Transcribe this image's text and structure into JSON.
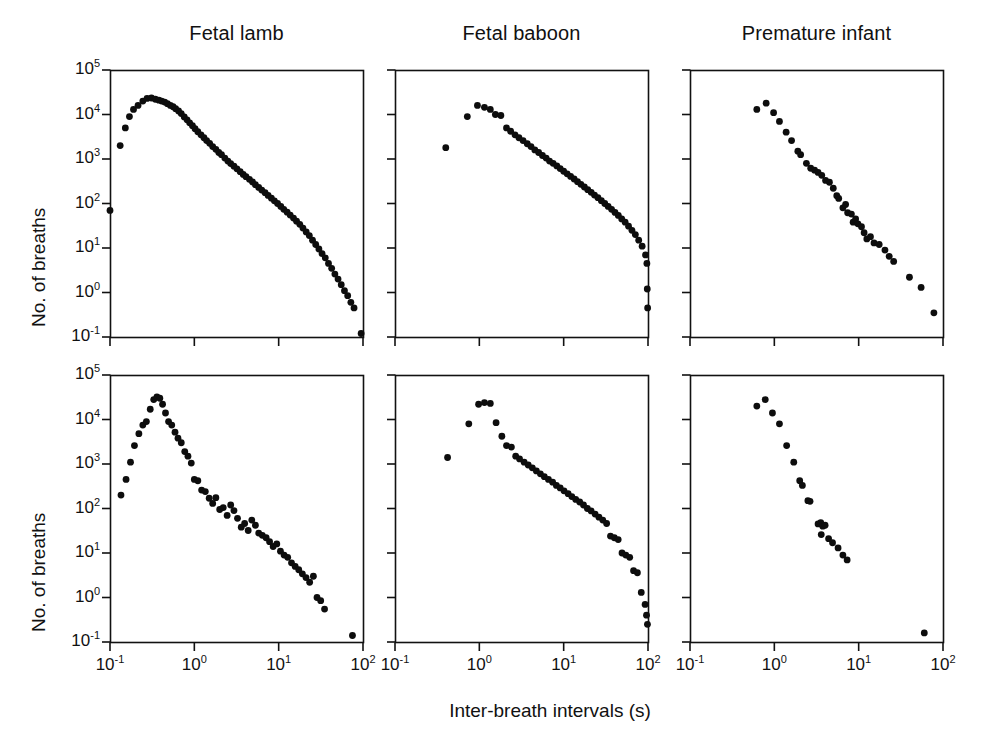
{
  "figure": {
    "xlabel": "Inter-breath intervals (s)",
    "ylabel": "No. of breaths",
    "background": "#ffffff",
    "marker_color": "#0d0d0d",
    "axis_color": "#111111"
  },
  "axes": {
    "x_ticks": [
      "10-1",
      "100",
      "101",
      "102"
    ],
    "x_tick_mantissa": [
      "10",
      "10",
      "10",
      "10"
    ],
    "x_tick_exponent": [
      "-1",
      "0",
      "1",
      "2"
    ],
    "y_ticks": [
      "105",
      "104",
      "103",
      "102",
      "101",
      "100",
      "10-1"
    ],
    "y_tick_mantissa": [
      "10",
      "10",
      "10",
      "10",
      "10",
      "10",
      "10"
    ],
    "y_tick_exponent": [
      "5",
      "4",
      "3",
      "2",
      "1",
      "0",
      "-1"
    ],
    "xlim": [
      -1,
      2
    ],
    "ylim": [
      -1,
      5
    ],
    "xscale": "log",
    "yscale": "log",
    "grid": false
  },
  "titles": {
    "col1": "Fetal lamb",
    "col2": "Fetal baboon",
    "col3": "Premature infant"
  },
  "chart_data": [
    {
      "type": "scatter",
      "panel": "top-left",
      "title": "Fetal lamb",
      "xlabel": "Inter-breath intervals (s)",
      "ylabel": "No. of breaths",
      "xlim": [
        0.1,
        100
      ],
      "ylim": [
        0.1,
        100000
      ],
      "xscale": "log",
      "yscale": "log",
      "grid": false,
      "points": [
        [
          0.1,
          70
        ],
        [
          0.132,
          2000
        ],
        [
          0.152,
          5000
        ],
        [
          0.17,
          9000
        ],
        [
          0.19,
          13000
        ],
        [
          0.215,
          16000
        ],
        [
          0.245,
          20000
        ],
        [
          0.275,
          23000
        ],
        [
          0.31,
          23500
        ],
        [
          0.345,
          22000
        ],
        [
          0.38,
          21000
        ],
        [
          0.41,
          20000
        ],
        [
          0.445,
          19000
        ],
        [
          0.48,
          17500
        ],
        [
          0.52,
          16000
        ],
        [
          0.56,
          15000
        ],
        [
          0.6,
          13500
        ],
        [
          0.65,
          12000
        ],
        [
          0.7,
          10500
        ],
        [
          0.76,
          8800
        ],
        [
          0.82,
          7600
        ],
        [
          0.88,
          6500
        ],
        [
          0.95,
          5600
        ],
        [
          1.02,
          4800
        ],
        [
          1.1,
          4100
        ],
        [
          1.2,
          3500
        ],
        [
          1.3,
          3000
        ],
        [
          1.4,
          2600
        ],
        [
          1.52,
          2250
        ],
        [
          1.65,
          1900
        ],
        [
          1.8,
          1650
        ],
        [
          1.95,
          1400
        ],
        [
          2.1,
          1250
        ],
        [
          2.3,
          1050
        ],
        [
          2.5,
          900
        ],
        [
          2.7,
          790
        ],
        [
          2.95,
          690
        ],
        [
          3.2,
          600
        ],
        [
          3.5,
          520
        ],
        [
          3.8,
          450
        ],
        [
          4.1,
          400
        ],
        [
          4.5,
          350
        ],
        [
          4.9,
          305
        ],
        [
          5.3,
          265
        ],
        [
          5.8,
          230
        ],
        [
          6.3,
          200
        ],
        [
          6.9,
          175
        ],
        [
          7.5,
          152
        ],
        [
          8.2,
          132
        ],
        [
          8.9,
          115
        ],
        [
          9.7,
          100
        ],
        [
          10.6,
          86
        ],
        [
          11.5,
          74
        ],
        [
          12.6,
          64
        ],
        [
          13.7,
          55
        ],
        [
          15.0,
          47
        ],
        [
          16.3,
          40
        ],
        [
          17.8,
          34
        ],
        [
          19.4,
          28
        ],
        [
          21.2,
          23
        ],
        [
          23.1,
          19
        ],
        [
          25.2,
          15
        ],
        [
          27.5,
          12
        ],
        [
          30.0,
          9.5
        ],
        [
          32.7,
          7.5
        ],
        [
          35.7,
          6.0
        ],
        [
          39.0,
          4.5
        ],
        [
          42.5,
          3.5
        ],
        [
          46.4,
          2.6
        ],
        [
          50.6,
          2.0
        ],
        [
          55.2,
          1.5
        ],
        [
          60.3,
          1.1
        ],
        [
          65.8,
          0.85
        ],
        [
          71.8,
          0.6
        ],
        [
          78.3,
          0.45
        ],
        [
          95.0,
          0.12
        ]
      ]
    },
    {
      "type": "scatter",
      "panel": "top-middle",
      "title": "Fetal baboon",
      "xlabel": "Inter-breath intervals (s)",
      "ylabel": "No. of breaths",
      "xlim": [
        0.1,
        100
      ],
      "ylim": [
        0.1,
        100000
      ],
      "xscale": "log",
      "yscale": "log",
      "grid": false,
      "points": [
        [
          0.4,
          1800
        ],
        [
          0.72,
          9000
        ],
        [
          0.95,
          16000
        ],
        [
          1.15,
          14500
        ],
        [
          1.35,
          13000
        ],
        [
          1.55,
          10000
        ],
        [
          1.8,
          9500
        ],
        [
          2.1,
          5000
        ],
        [
          2.35,
          4200
        ],
        [
          2.65,
          3500
        ],
        [
          2.95,
          3000
        ],
        [
          3.3,
          2600
        ],
        [
          3.7,
          2200
        ],
        [
          4.1,
          1900
        ],
        [
          4.55,
          1600
        ],
        [
          5.05,
          1400
        ],
        [
          5.6,
          1200
        ],
        [
          6.2,
          1050
        ],
        [
          6.8,
          900
        ],
        [
          7.5,
          800
        ],
        [
          8.3,
          700
        ],
        [
          9.1,
          610
        ],
        [
          10.0,
          530
        ],
        [
          11.0,
          465
        ],
        [
          12.1,
          405
        ],
        [
          13.3,
          355
        ],
        [
          14.6,
          310
        ],
        [
          16.0,
          270
        ],
        [
          17.6,
          235
        ],
        [
          19.3,
          205
        ],
        [
          21.2,
          178
        ],
        [
          23.2,
          155
        ],
        [
          25.5,
          135
        ],
        [
          28.0,
          116
        ],
        [
          30.7,
          100
        ],
        [
          33.7,
          86
        ],
        [
          37.0,
          74
        ],
        [
          40.6,
          63
        ],
        [
          44.5,
          54
        ],
        [
          48.8,
          45
        ],
        [
          53.6,
          38
        ],
        [
          58.8,
          31
        ],
        [
          64.5,
          25
        ],
        [
          70.8,
          20
        ],
        [
          77.6,
          15
        ],
        [
          85.2,
          11
        ],
        [
          93.5,
          7
        ],
        [
          97.0,
          4.5
        ],
        [
          98.0,
          1.2
        ],
        [
          99.0,
          0.45
        ]
      ]
    },
    {
      "type": "scatter",
      "panel": "top-right",
      "title": "Premature infant",
      "xlabel": "Inter-breath intervals (s)",
      "ylabel": "No. of breaths",
      "xlim": [
        0.1,
        100
      ],
      "ylim": [
        0.1,
        100000
      ],
      "xscale": "log",
      "yscale": "log",
      "grid": false,
      "points": [
        [
          0.62,
          13000
        ],
        [
          0.8,
          18000
        ],
        [
          0.98,
          11000
        ],
        [
          1.15,
          7000
        ],
        [
          1.38,
          4000
        ],
        [
          1.6,
          2600
        ],
        [
          1.9,
          1500
        ],
        [
          2.05,
          1250
        ],
        [
          2.4,
          800
        ],
        [
          2.7,
          620
        ],
        [
          3.0,
          560
        ],
        [
          3.3,
          500
        ],
        [
          3.65,
          430
        ],
        [
          4.05,
          330
        ],
        [
          4.5,
          300
        ],
        [
          5.0,
          220
        ],
        [
          5.5,
          150
        ],
        [
          5.8,
          130
        ],
        [
          6.5,
          80
        ],
        [
          7.0,
          95
        ],
        [
          7.4,
          62
        ],
        [
          8.2,
          58
        ],
        [
          8.6,
          38
        ],
        [
          9.2,
          45
        ],
        [
          9.8,
          35
        ],
        [
          10.8,
          30
        ],
        [
          11.6,
          22
        ],
        [
          12.5,
          16
        ],
        [
          13.8,
          18
        ],
        [
          15.2,
          13
        ],
        [
          17.5,
          12
        ],
        [
          20.5,
          9
        ],
        [
          23.0,
          6.5
        ],
        [
          26.0,
          5.0
        ],
        [
          40.0,
          2.2
        ],
        [
          55.0,
          1.3
        ],
        [
          78.0,
          0.35
        ]
      ]
    },
    {
      "type": "scatter",
      "panel": "bottom-left",
      "title": "Fetal lamb",
      "xlabel": "Inter-breath intervals (s)",
      "ylabel": "No. of breaths",
      "xlim": [
        0.1,
        100
      ],
      "ylim": [
        0.1,
        100000
      ],
      "xscale": "log",
      "yscale": "log",
      "grid": false,
      "points": [
        [
          0.135,
          200
        ],
        [
          0.155,
          450
        ],
        [
          0.175,
          1100
        ],
        [
          0.195,
          2600
        ],
        [
          0.22,
          4800
        ],
        [
          0.245,
          7500
        ],
        [
          0.27,
          9000
        ],
        [
          0.3,
          17000
        ],
        [
          0.33,
          28000
        ],
        [
          0.36,
          32000
        ],
        [
          0.39,
          30000
        ],
        [
          0.42,
          22000
        ],
        [
          0.455,
          14000
        ],
        [
          0.495,
          9000
        ],
        [
          0.54,
          7500
        ],
        [
          0.59,
          5200
        ],
        [
          0.64,
          3800
        ],
        [
          0.7,
          3000
        ],
        [
          0.77,
          1900
        ],
        [
          0.84,
          1500
        ],
        [
          0.92,
          1050
        ],
        [
          1.0,
          450
        ],
        [
          1.1,
          420
        ],
        [
          1.22,
          260
        ],
        [
          1.35,
          240
        ],
        [
          1.5,
          170
        ],
        [
          1.65,
          130
        ],
        [
          1.8,
          175
        ],
        [
          2.0,
          95
        ],
        [
          2.2,
          105
        ],
        [
          2.45,
          70
        ],
        [
          2.7,
          120
        ],
        [
          2.95,
          90
        ],
        [
          3.25,
          60
        ],
        [
          3.6,
          38
        ],
        [
          3.95,
          46
        ],
        [
          4.35,
          32
        ],
        [
          4.8,
          55
        ],
        [
          5.3,
          42
        ],
        [
          5.8,
          28
        ],
        [
          6.4,
          25
        ],
        [
          7.1,
          22
        ],
        [
          7.8,
          18
        ],
        [
          8.6,
          14
        ],
        [
          9.5,
          16
        ],
        [
          10.5,
          11
        ],
        [
          11.6,
          9
        ],
        [
          12.8,
          8
        ],
        [
          14.2,
          6
        ],
        [
          15.7,
          5
        ],
        [
          17.3,
          4.2
        ],
        [
          19.1,
          3.4
        ],
        [
          21.1,
          2.8
        ],
        [
          23.3,
          2.2
        ],
        [
          25.8,
          3.0
        ],
        [
          28.5,
          1.0
        ],
        [
          31.5,
          0.85
        ],
        [
          35.0,
          0.55
        ],
        [
          75.0,
          0.14
        ]
      ]
    },
    {
      "type": "scatter",
      "panel": "bottom-middle",
      "title": "Fetal baboon",
      "xlabel": "Inter-breath intervals (s)",
      "ylabel": "No. of breaths",
      "xlim": [
        0.1,
        100
      ],
      "ylim": [
        0.1,
        100000
      ],
      "xscale": "log",
      "yscale": "log",
      "grid": false,
      "points": [
        [
          0.42,
          1400
        ],
        [
          0.75,
          8000
        ],
        [
          0.98,
          22000
        ],
        [
          1.15,
          24000
        ],
        [
          1.35,
          23000
        ],
        [
          1.58,
          8500
        ],
        [
          1.85,
          4200
        ],
        [
          2.1,
          2600
        ],
        [
          2.4,
          2400
        ],
        [
          2.7,
          1500
        ],
        [
          3.0,
          1300
        ],
        [
          3.4,
          1100
        ],
        [
          3.8,
          950
        ],
        [
          4.25,
          820
        ],
        [
          4.75,
          700
        ],
        [
          5.3,
          600
        ],
        [
          5.9,
          520
        ],
        [
          6.6,
          450
        ],
        [
          7.4,
          390
        ],
        [
          8.2,
          330
        ],
        [
          9.1,
          290
        ],
        [
          10.1,
          250
        ],
        [
          11.3,
          215
        ],
        [
          12.5,
          185
        ],
        [
          13.9,
          160
        ],
        [
          15.5,
          140
        ],
        [
          17.2,
          120
        ],
        [
          19.1,
          100
        ],
        [
          21.2,
          88
        ],
        [
          23.6,
          75
        ],
        [
          26.2,
          64
        ],
        [
          29.1,
          55
        ],
        [
          32.3,
          46
        ],
        [
          35.9,
          24
        ],
        [
          39.9,
          22
        ],
        [
          44.3,
          20
        ],
        [
          49.2,
          10
        ],
        [
          54.6,
          9
        ],
        [
          60.7,
          8
        ],
        [
          67.4,
          4
        ],
        [
          74.9,
          3.6
        ],
        [
          83.2,
          1.3
        ],
        [
          92.4,
          0.7
        ],
        [
          96.0,
          0.4
        ],
        [
          98.5,
          0.25
        ]
      ]
    },
    {
      "type": "scatter",
      "panel": "bottom-right",
      "title": "Premature infant",
      "xlabel": "Inter-breath intervals (s)",
      "ylabel": "No. of breaths",
      "xlim": [
        0.1,
        100
      ],
      "ylim": [
        0.1,
        100000
      ],
      "xscale": "log",
      "yscale": "log",
      "grid": false,
      "points": [
        [
          0.62,
          20000
        ],
        [
          0.78,
          28000
        ],
        [
          0.95,
          14000
        ],
        [
          1.15,
          8000
        ],
        [
          1.4,
          2600
        ],
        [
          1.7,
          1100
        ],
        [
          2.0,
          420
        ],
        [
          2.15,
          330
        ],
        [
          2.5,
          150
        ],
        [
          2.65,
          145
        ],
        [
          3.3,
          45
        ],
        [
          3.55,
          48
        ],
        [
          3.75,
          40
        ],
        [
          4.0,
          42
        ],
        [
          3.6,
          26
        ],
        [
          4.4,
          21
        ],
        [
          4.9,
          17
        ],
        [
          5.7,
          13
        ],
        [
          6.5,
          9
        ],
        [
          7.3,
          7
        ],
        [
          60.0,
          0.16
        ]
      ]
    }
  ]
}
